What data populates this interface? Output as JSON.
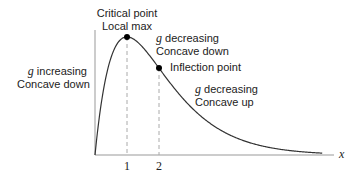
{
  "diagram": {
    "curve": {
      "function": "g(x) = x e^{-x}",
      "x_start": 0,
      "x_end": 7.1,
      "color": "#333333"
    },
    "axis": {
      "x_label": "x",
      "ticks": [
        "1",
        "2"
      ]
    },
    "points": [
      {
        "name": "local-max",
        "x": 1,
        "title": "Critical point",
        "subtitle": "Local max"
      },
      {
        "name": "inflection",
        "x": 2,
        "title": "Inflection point"
      }
    ],
    "annotations": {
      "left": {
        "var": "g",
        "line1": " increasing",
        "line2": "Concave down"
      },
      "mid": {
        "var": "g",
        "line1": " decreasing",
        "line2": "Concave down"
      },
      "right": {
        "var": "g",
        "line1": " decreasing",
        "line2": "Concave up"
      }
    }
  }
}
